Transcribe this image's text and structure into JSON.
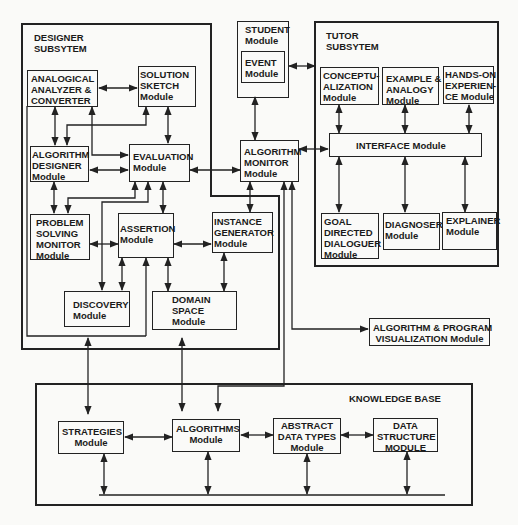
{
  "subsystems": {
    "designer": {
      "title_line1": "DESIGNER",
      "title_line2": "SUBSYTEM"
    },
    "tutor": {
      "title_line1": "TUTOR",
      "title_line2": "SUBSYTEM"
    },
    "knowledge_base": {
      "title": "KNOWLEDGE BASE"
    }
  },
  "modules": {
    "analogical": {
      "lines": [
        "ANALOGICAL",
        "ANALYZER &",
        "CONVERTER"
      ]
    },
    "solution_sketch": {
      "lines": [
        "SOLUTION",
        "SKETCH",
        "Module"
      ]
    },
    "algorithm_designer": {
      "lines": [
        "ALGORITHM",
        "DESIGNER",
        "Module"
      ]
    },
    "evaluation": {
      "lines": [
        "EVALUATION",
        "Module"
      ]
    },
    "problem_solving": {
      "lines": [
        "PROBLEM",
        "SOLVING",
        "MONITOR",
        "Module"
      ]
    },
    "assertion": {
      "lines": [
        "ASSERTION",
        "Module"
      ]
    },
    "instance_generator": {
      "lines": [
        "INSTANCE",
        "GENERATOR",
        "Module"
      ]
    },
    "discovery": {
      "lines": [
        "DISCOVERY",
        "Module"
      ]
    },
    "domain_space": {
      "lines": [
        "DOMAIN",
        "SPACE",
        "Module"
      ]
    },
    "student": {
      "lines": [
        "STUDENT",
        "Module"
      ]
    },
    "event": {
      "lines": [
        "EVENT",
        "Module"
      ]
    },
    "algorithm_monitor": {
      "lines": [
        "ALGORITHM",
        "MONITOR",
        "Module"
      ]
    },
    "conceptualization": {
      "lines": [
        "CONCEPTU-",
        "ALIZATION",
        "Module"
      ]
    },
    "example_analogy": {
      "lines": [
        "EXAMPLE &",
        "ANALOGY",
        "Module"
      ]
    },
    "hands_on": {
      "lines": [
        "HANDS-ON",
        "EXPERIEN-",
        "CE Module"
      ]
    },
    "interface": {
      "lines": [
        "INTERFACE Module"
      ]
    },
    "goal_directed": {
      "lines": [
        "GOAL",
        "DIRECTED",
        "DIALOGUER",
        "Module"
      ]
    },
    "diagnoser": {
      "lines": [
        "DIAGNOSER",
        "Module"
      ]
    },
    "explainer": {
      "lines": [
        "EXPLAINER",
        "Module"
      ]
    },
    "visualization": {
      "lines": [
        "ALGORITHM & PROGRAM",
        "VISUALIZATION Module"
      ]
    },
    "strategies": {
      "lines": [
        "STRATEGIES",
        "Module"
      ]
    },
    "algorithms": {
      "lines": [
        "ALGORITHMS",
        "Module"
      ]
    },
    "abstract_data_types": {
      "lines": [
        "ABSTRACT",
        "DATA TYPES",
        "Module"
      ]
    },
    "data_structure": {
      "lines": [
        "DATA",
        "STRUCTURE",
        "MODULE"
      ]
    }
  },
  "colors": {
    "line": "#222222",
    "background": "#fafaf8",
    "text": "#1a1a1a"
  }
}
